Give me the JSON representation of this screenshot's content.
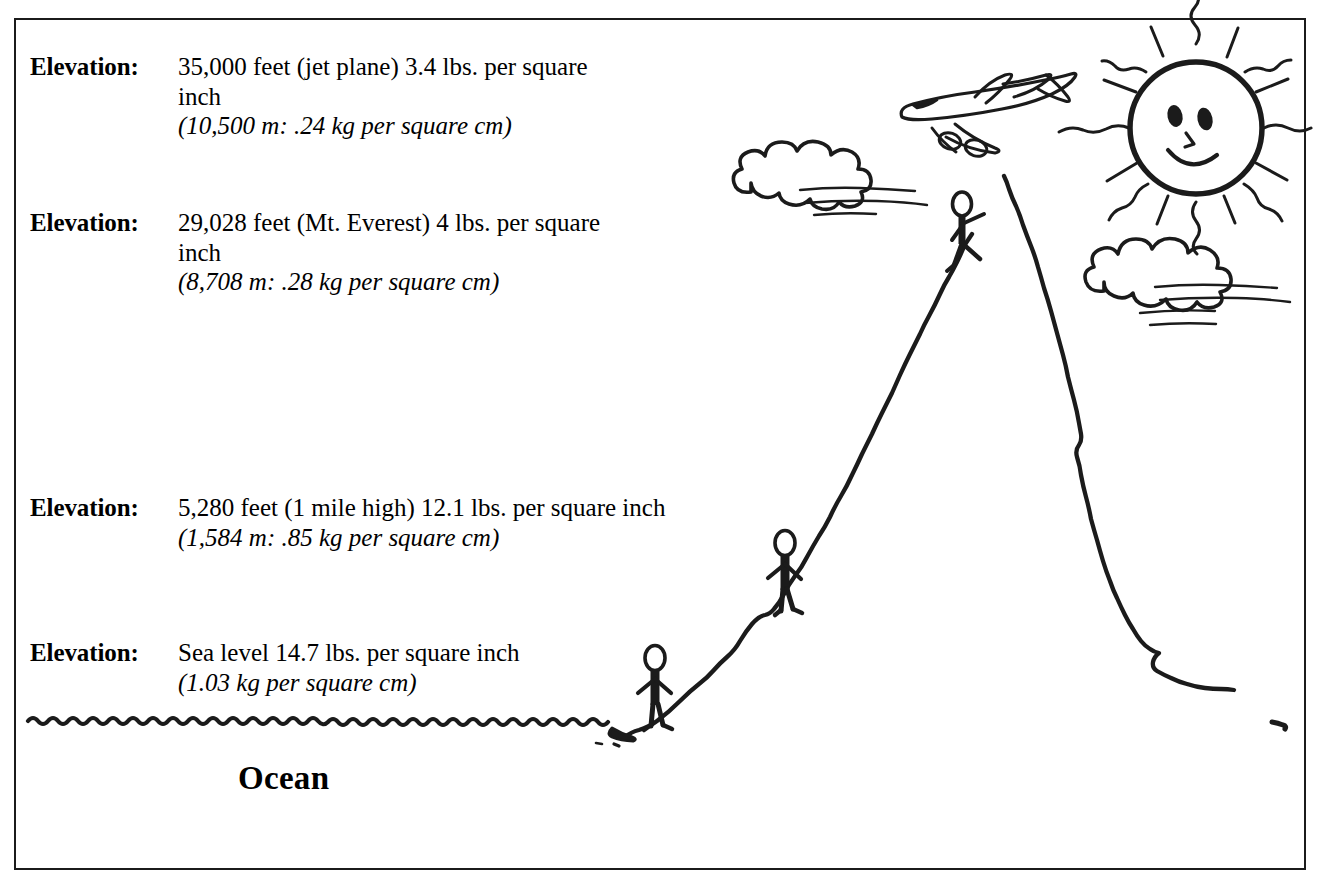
{
  "figure": {
    "background_color": "#ffffff",
    "ink_color": "#1b1b1b",
    "border_color": "#1b1b1b"
  },
  "elevations": [
    {
      "label": "Elevation:",
      "imperial": "35,000 feet (jet plane) 3.4 lbs. per square inch",
      "metric": "(10,500 m: .24 kg per square cm)",
      "altitude_feet": 35000,
      "altitude_meters": 10500,
      "pressure_psi": 3.4,
      "pressure_kg_cm2": 0.24,
      "place": "jet plane"
    },
    {
      "label": "Elevation:",
      "imperial": "29,028 feet (Mt. Everest) 4 lbs. per square inch",
      "metric": "(8,708 m: .28 kg per square cm)",
      "altitude_feet": 29028,
      "altitude_meters": 8708,
      "pressure_psi": 4,
      "pressure_kg_cm2": 0.28,
      "place": "Mt. Everest"
    },
    {
      "label": "Elevation:",
      "imperial": "5,280 feet (1 mile high) 12.1 lbs. per square inch",
      "metric": "(1,584 m: .85 kg per square cm)",
      "altitude_feet": 5280,
      "altitude_meters": 1584,
      "pressure_psi": 12.1,
      "pressure_kg_cm2": 0.85,
      "place": "1 mile high"
    },
    {
      "label": "Elevation:",
      "imperial": "Sea level 14.7 lbs. per square inch",
      "metric": "(1.03 kg per square cm)",
      "altitude_feet": 0,
      "altitude_meters": 0,
      "pressure_psi": 14.7,
      "pressure_kg_cm2": 1.03,
      "place": "Sea level"
    }
  ],
  "ocean": {
    "label": "Ocean"
  },
  "illustration": {
    "sun": "sun-smiley-face",
    "clouds": [
      "cloud-upper-left",
      "cloud-right"
    ],
    "airplane": "jet-airplane",
    "mountain": "mountain-peak-outline",
    "figures": [
      "climber-at-summit",
      "hiker-mid-slope",
      "person-at-sea-level"
    ],
    "water": "ocean-wavy-line"
  }
}
